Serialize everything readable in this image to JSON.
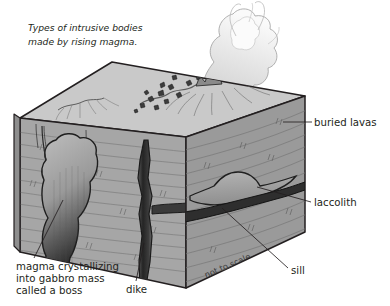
{
  "figure": {
    "title_line1": "Types of intrusive bodies",
    "title_line2": "made by rising magma.",
    "scale_note": "not to scale",
    "background_color": "#ffffff"
  },
  "labels": {
    "buried_lavas": "buried lavas",
    "laccolith": "laccolith",
    "sill": "sill",
    "dike": "dike",
    "boss_line1": "magma crystallizing",
    "boss_line2": "into gabbro mass",
    "boss_line3": "called a boss"
  },
  "colors": {
    "block_top": "#c9c9c9",
    "block_front": "#a6a6a6",
    "block_right": "#9a9a9a",
    "block_left": "#8e8e8e",
    "outline": "#231f20",
    "intrusion_dark": "#2f2f2f",
    "plume": "#e8e8e8",
    "text": "#231f20"
  },
  "geology": {
    "features": [
      {
        "name": "buried lavas",
        "type": "layered volcanic beds",
        "location": "upper strata, right face"
      },
      {
        "name": "laccolith",
        "type": "mushroom-shaped concordant intrusion",
        "location": "mid-depth, right face"
      },
      {
        "name": "sill",
        "type": "tabular concordant sheet",
        "location": "horizontal dark band, right face"
      },
      {
        "name": "dike",
        "type": "discordant vertical sheet",
        "location": "center, feeding surface vent"
      },
      {
        "name": "boss",
        "type": "crystallizing gabbro pluton",
        "location": "lower left, front face"
      }
    ],
    "surface_activity": [
      "eruption plume",
      "ejecta blocks",
      "crater rim",
      "lava flows"
    ]
  }
}
